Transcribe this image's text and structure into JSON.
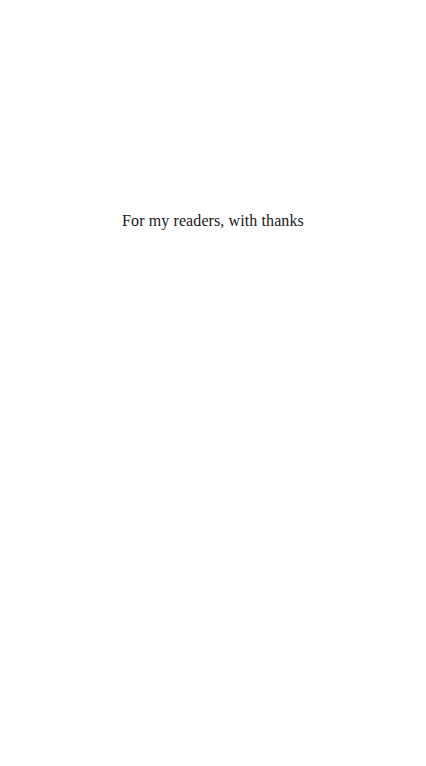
{
  "page": {
    "dedication": "For my readers, with thanks"
  }
}
